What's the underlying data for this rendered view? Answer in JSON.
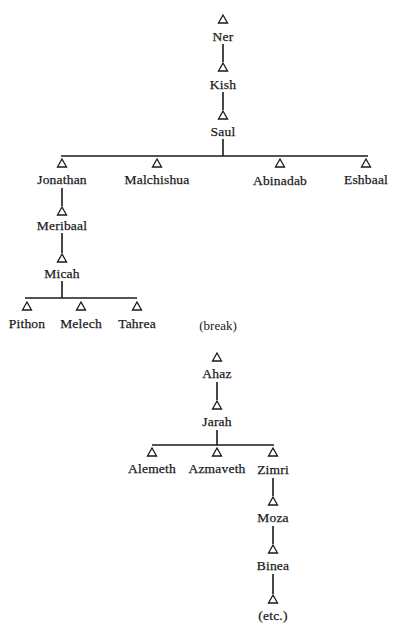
{
  "diagram": {
    "type": "genealogy-tree",
    "colors": {
      "ink": "#1a1a1a",
      "background": "#ffffff"
    },
    "symbol": "triangle-icon (male)",
    "trees": [
      {
        "id": "saul-lineage",
        "nodes": [
          {
            "id": "ner",
            "label": "Ner",
            "x": 223,
            "tri_y": 15,
            "text_y": 30
          },
          {
            "id": "kish",
            "label": "Kish",
            "x": 223,
            "tri_y": 63,
            "text_y": 78
          },
          {
            "id": "saul",
            "label": "Saul",
            "x": 223,
            "tri_y": 111,
            "text_y": 125
          },
          {
            "id": "jonathan",
            "label": "Jonathan",
            "x": 62,
            "tri_y": 159,
            "text_y": 173
          },
          {
            "id": "malchishua",
            "label": "Malchishua",
            "x": 157,
            "tri_y": 159,
            "text_y": 173
          },
          {
            "id": "abinadab",
            "label": "Abinadab",
            "x": 280,
            "tri_y": 159,
            "text_y": 174
          },
          {
            "id": "eshbaal",
            "label": "Eshbaal",
            "x": 366,
            "tri_y": 159,
            "text_y": 173
          },
          {
            "id": "meribaal",
            "label": "Meribaal",
            "x": 62,
            "tri_y": 207,
            "text_y": 219
          },
          {
            "id": "micah",
            "label": "Micah",
            "x": 62,
            "tri_y": 254,
            "text_y": 267
          },
          {
            "id": "pithon",
            "label": "Pithon",
            "x": 27,
            "tri_y": 302,
            "text_y": 317
          },
          {
            "id": "melech",
            "label": "Melech",
            "x": 81,
            "tri_y": 302,
            "text_y": 317
          },
          {
            "id": "tahrea",
            "label": "Tahrea",
            "x": 137,
            "tri_y": 302,
            "text_y": 317
          }
        ]
      },
      {
        "id": "ahaz-lineage",
        "nodes": [
          {
            "id": "ahaz",
            "label": "Ahaz",
            "x": 217,
            "tri_y": 353,
            "text_y": 367
          },
          {
            "id": "jarah",
            "label": "Jarah",
            "x": 217,
            "tri_y": 401,
            "text_y": 415
          },
          {
            "id": "alemeth",
            "label": "Alemeth",
            "x": 152,
            "tri_y": 448,
            "text_y": 462
          },
          {
            "id": "azmaveth",
            "label": "Azmaveth",
            "x": 217,
            "tri_y": 448,
            "text_y": 462
          },
          {
            "id": "zimri",
            "label": "Zimri",
            "x": 273,
            "tri_y": 448,
            "text_y": 463
          },
          {
            "id": "moza",
            "label": "Moza",
            "x": 273,
            "tri_y": 497,
            "text_y": 511
          },
          {
            "id": "binea",
            "label": "Binea",
            "x": 273,
            "tri_y": 545,
            "text_y": 559
          },
          {
            "id": "etc",
            "label": "(etc.)",
            "x": 273,
            "tri_y": 595,
            "text_y": 609,
            "no_triangle_label": true
          }
        ]
      }
    ],
    "notes": [
      {
        "id": "break",
        "label": "(break)",
        "x": 218,
        "y": 319
      }
    ],
    "vertical_lines": [
      {
        "x": 223,
        "y1": 44,
        "y2": 62
      },
      {
        "x": 223,
        "y1": 92,
        "y2": 110
      },
      {
        "x": 223,
        "y1": 139,
        "y2": 156
      },
      {
        "x": 62,
        "y1": 188,
        "y2": 206
      },
      {
        "x": 62,
        "y1": 233,
        "y2": 253
      },
      {
        "x": 62,
        "y1": 281,
        "y2": 298
      },
      {
        "x": 217,
        "y1": 382,
        "y2": 400
      },
      {
        "x": 217,
        "y1": 430,
        "y2": 445
      },
      {
        "x": 273,
        "y1": 478,
        "y2": 496
      },
      {
        "x": 273,
        "y1": 526,
        "y2": 544
      },
      {
        "x": 273,
        "y1": 574,
        "y2": 594
      }
    ],
    "horizontal_lines": [
      {
        "y": 156,
        "x1": 61,
        "x2": 368
      },
      {
        "y": 298,
        "x1": 25,
        "x2": 137
      },
      {
        "y": 445,
        "x1": 152,
        "x2": 274
      }
    ]
  }
}
